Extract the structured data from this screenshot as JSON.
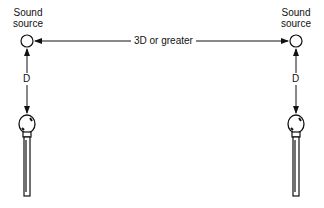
{
  "diagram": {
    "left_source": {
      "label_line1": "Sound",
      "label_line2": "source"
    },
    "right_source": {
      "label_line1": "Sound",
      "label_line2": "source"
    },
    "separation_label": "3D or greater",
    "left_distance_label": "D",
    "right_distance_label": "D",
    "colors": {
      "stroke": "#111111",
      "background": "#ffffff"
    }
  }
}
